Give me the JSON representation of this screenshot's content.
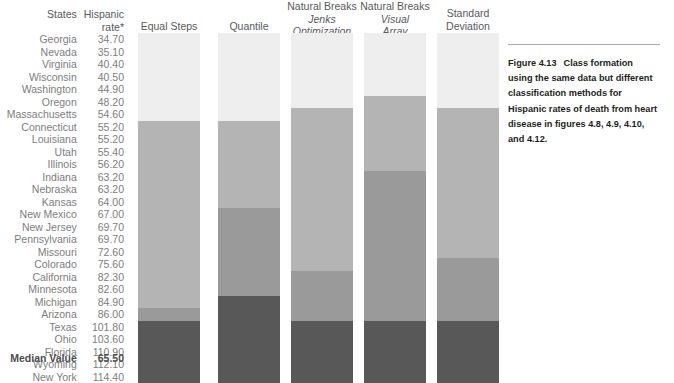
{
  "table": {
    "header_states": "States",
    "header_rate_line1": "Hispanic",
    "header_rate_line2": "rate*",
    "rows": [
      {
        "state": "Georgia",
        "rate": "34.70"
      },
      {
        "state": "Nevada",
        "rate": "35.10"
      },
      {
        "state": "Virginia",
        "rate": "40.40"
      },
      {
        "state": "Wisconsin",
        "rate": "40.50"
      },
      {
        "state": "Washington",
        "rate": "44.90"
      },
      {
        "state": "Oregon",
        "rate": "48.20"
      },
      {
        "state": "Massachusetts",
        "rate": "54.60"
      },
      {
        "state": "Connecticut",
        "rate": "55.20"
      },
      {
        "state": "Louisiana",
        "rate": "55.20"
      },
      {
        "state": "Utah",
        "rate": "55.40"
      },
      {
        "state": "Illinois",
        "rate": "56.20"
      },
      {
        "state": "Indiana",
        "rate": "63.20"
      },
      {
        "state": "Nebraska",
        "rate": "63.20"
      },
      {
        "state": "Kansas",
        "rate": "64.00"
      },
      {
        "state": "New Mexico",
        "rate": "67.00"
      },
      {
        "state": "New Jersey",
        "rate": "69.70"
      },
      {
        "state": "Pennsylvania",
        "rate": "69.70"
      },
      {
        "state": "Missouri",
        "rate": "72.60"
      },
      {
        "state": "Colorado",
        "rate": "75.60"
      },
      {
        "state": "California",
        "rate": "82.30"
      },
      {
        "state": "Minnesota",
        "rate": "82.60"
      },
      {
        "state": "Michigan",
        "rate": "84.90"
      },
      {
        "state": "Arizona",
        "rate": "86.00"
      },
      {
        "state": "Texas",
        "rate": "101.80"
      },
      {
        "state": "Ohio",
        "rate": "103.60"
      },
      {
        "state": "Florida",
        "rate": "110.90"
      },
      {
        "state": "Wyoming",
        "rate": "112.10"
      },
      {
        "state": "New York",
        "rate": "114.40"
      }
    ],
    "median_label": "Median Value",
    "median_value": "65.50"
  },
  "caption": {
    "figure_number": "Figure 4.13",
    "line1": "Class formation",
    "line2": "using the same data but different",
    "line3": "classification methods for",
    "line4": "Hispanic rates of death from heart",
    "line5": "disease in figures 4.8, 4.9, 4.10,",
    "line6": "and 4.12."
  },
  "palette": {
    "class1": "#eeeeee",
    "class2": "#b4b4b4",
    "class3": "#9a9a9a",
    "class4": "#585858",
    "background": "#ffffff",
    "text_gray": "#7d7d7d",
    "header_gray": "#58595b",
    "caption_black": "#231f20",
    "rule_gray": "#a9a9a9"
  },
  "chart_data": {
    "type": "bar",
    "title": "Class formation using the same data but different classification methods",
    "xlabel": "Classification method",
    "ylabel": "Hispanic rate* of death from heart disease",
    "grid": false,
    "legend": "none",
    "categories": [
      "Georgia",
      "Nevada",
      "Virginia",
      "Wisconsin",
      "Washington",
      "Oregon",
      "Massachusetts",
      "Connecticut",
      "Louisiana",
      "Utah",
      "Illinois",
      "Indiana",
      "Nebraska",
      "Kansas",
      "New Mexico",
      "New Jersey",
      "Pennsylvania",
      "Missouri",
      "Colorado",
      "California",
      "Minnesota",
      "Michigan",
      "Arizona",
      "Texas",
      "Ohio",
      "Florida",
      "Wyoming",
      "New York"
    ],
    "values": [
      34.7,
      35.1,
      40.4,
      40.5,
      44.9,
      48.2,
      54.6,
      55.2,
      55.2,
      55.4,
      56.2,
      63.2,
      63.2,
      64.0,
      67.0,
      69.7,
      69.7,
      72.6,
      75.6,
      82.3,
      82.6,
      84.9,
      86.0,
      101.8,
      103.6,
      110.9,
      112.1,
      114.4
    ],
    "median": 65.5,
    "value_range": [
      34.7,
      114.4
    ],
    "columns": [
      {
        "name": "Equal Steps",
        "title_lines": [
          "Equal Steps"
        ],
        "classes": 4,
        "class_counts": [
          7,
          15,
          4,
          5
        ],
        "first_index_of_class": [
          0,
          7,
          22,
          23
        ],
        "break_values": [
          55.2,
          86.0,
          101.8
        ]
      },
      {
        "name": "Quantile",
        "title_lines": [
          "Quantile"
        ],
        "classes": 4,
        "class_counts": [
          7,
          7,
          7,
          7
        ],
        "first_index_of_class": [
          0,
          7,
          14,
          21
        ],
        "break_values": [
          55.2,
          67.0,
          84.9
        ]
      },
      {
        "name": "Natural Breaks Jenks Optimization",
        "title_lines": [
          "Natural Breaks",
          "Jenks",
          "Optimization"
        ],
        "classes": 4,
        "class_counts": [
          6,
          13,
          4,
          5
        ],
        "first_index_of_class": [
          0,
          6,
          19,
          23
        ],
        "break_values": [
          48.2,
          75.6,
          101.8
        ]
      },
      {
        "name": "Natural Breaks Visual Array",
        "title_lines": [
          "Natural Breaks",
          "Visual",
          "Array"
        ],
        "classes": 4,
        "class_counts": [
          5,
          6,
          12,
          5
        ],
        "first_index_of_class": [
          0,
          5,
          11,
          23
        ],
        "break_values": [
          44.9,
          56.2,
          101.8
        ]
      },
      {
        "name": "Standard Deviation",
        "title_lines": [
          "Standard",
          "Deviation"
        ],
        "classes": 4,
        "class_counts": [
          6,
          12,
          5,
          5
        ],
        "first_index_of_class": [
          0,
          6,
          18,
          23
        ],
        "break_values": [
          48.2,
          72.6,
          101.8
        ]
      }
    ]
  }
}
